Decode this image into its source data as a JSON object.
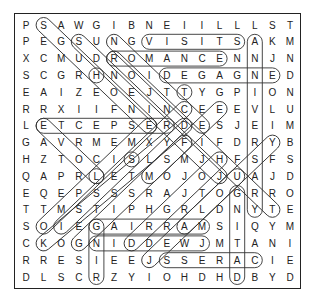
{
  "puzzle": {
    "type": "word-search",
    "rows": 16,
    "cols": 16,
    "grid": [
      "PSAWGIBNEIILLLST",
      "PEGSUNGVISITSAKM",
      "XCMUDROMANCENNJN",
      "SCGRHNOIDEGAGNED",
      "EAIZEOEJTTYGPION",
      "RRXIIFNINCEEEVLU",
      "LETCEPSERDESJEIM",
      "GAVRMEMXYFIFDRYB",
      "HZTOCISLSMJHFSFS",
      "QAPRLETMOJOJUAJD",
      "EQEPSSSRAJTOGRRO",
      "TTMSTIPHGRLDNYTE",
      "SOIEGAIRRAMSIQYM",
      "CKOGNIDDEWJMTANI",
      "RRESIEEJSSERACIE",
      "DLSCRZYIOHDHDBYD"
    ],
    "found_words": [
      {
        "word": "VISITS",
        "start": [
          1,
          7
        ],
        "end": [
          1,
          12
        ]
      },
      {
        "word": "ROMANCE",
        "start": [
          2,
          5
        ],
        "end": [
          2,
          11
        ]
      },
      {
        "word": "DEGAGNE",
        "start": [
          3,
          8
        ],
        "end": [
          3,
          14
        ]
      },
      {
        "word": "ETCEPSER",
        "start": [
          6,
          1
        ],
        "end": [
          6,
          8
        ]
      },
      {
        "word": "GAIRRAM",
        "start": [
          12,
          4
        ],
        "end": [
          12,
          10
        ]
      },
      {
        "word": "GNIDDEW",
        "start": [
          13,
          4
        ],
        "end": [
          13,
          10
        ]
      },
      {
        "word": "SSERAC",
        "start": [
          14,
          8
        ],
        "end": [
          14,
          13
        ]
      },
      {
        "word": "ANNIVERSARY",
        "start": [
          1,
          13
        ],
        "end": [
          11,
          13
        ]
      },
      {
        "word": "GNITAD",
        "start": [
          10,
          12
        ],
        "end": [
          15,
          12
        ]
      },
      {
        "word": "GNIR",
        "start": [
          12,
          4
        ],
        "end": [
          15,
          4
        ]
      },
      {
        "word": "H",
        "start": [
          3,
          4
        ],
        "end": [
          3,
          4
        ]
      },
      {
        "word": "S",
        "start": [
          8,
          6
        ],
        "end": [
          8,
          6
        ]
      },
      {
        "word": "L",
        "start": [
          9,
          4
        ],
        "end": [
          9,
          4
        ]
      },
      {
        "word": "diag-1",
        "start": [
          0,
          1
        ],
        "end": [
          6,
          7
        ]
      },
      {
        "word": "diag-2",
        "start": [
          1,
          3
        ],
        "end": [
          9,
          11
        ]
      },
      {
        "word": "diag-3",
        "start": [
          1,
          5
        ],
        "end": [
          6,
          10
        ]
      },
      {
        "word": "diag-4",
        "start": [
          2,
          5
        ],
        "end": [
          11,
          14
        ]
      },
      {
        "word": "diag-5",
        "start": [
          4,
          9
        ],
        "end": [
          4,
          9
        ]
      },
      {
        "word": "anti-1",
        "start": [
          5,
          11
        ],
        "end": [
          9,
          7
        ]
      },
      {
        "word": "anti-2",
        "start": [
          6,
          1
        ],
        "end": [
          9,
          4
        ]
      },
      {
        "word": "anti-3",
        "start": [
          7,
          14
        ],
        "end": [
          12,
          9
        ]
      },
      {
        "word": "anti-4",
        "start": [
          7,
          9
        ],
        "end": [
          13,
          3
        ]
      },
      {
        "word": "anti-5",
        "start": [
          5,
          9
        ],
        "end": [
          12,
          2
        ]
      },
      {
        "word": "anti-6",
        "start": [
          6,
          7
        ],
        "end": [
          12,
          1
        ]
      },
      {
        "word": "anti-7",
        "start": [
          8,
          11
        ],
        "end": [
          13,
          6
        ]
      },
      {
        "word": "anti-8",
        "start": [
          9,
          12
        ],
        "end": [
          14,
          7
        ]
      },
      {
        "word": "anti-9",
        "start": [
          6,
          9
        ],
        "end": [
          13,
          1
        ]
      }
    ]
  }
}
